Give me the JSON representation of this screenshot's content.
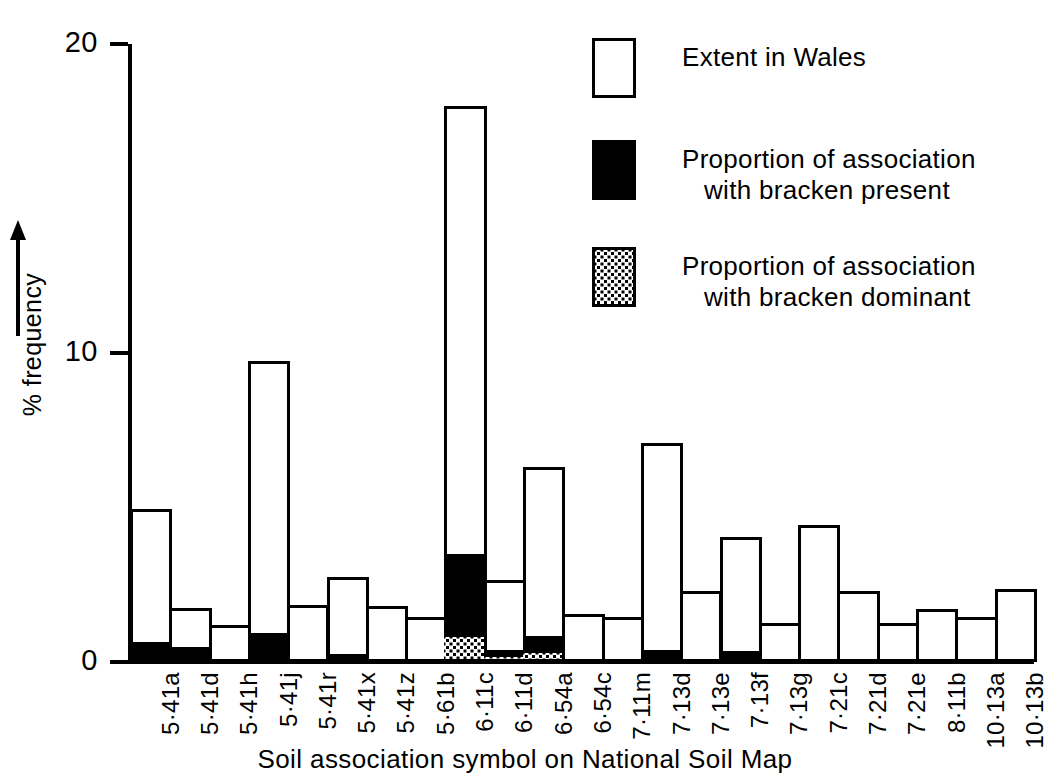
{
  "chart_data": {
    "type": "bar",
    "title": "",
    "xlabel": "Soil association symbol on National Soil Map",
    "ylabel": "% frequency",
    "ylim": [
      0,
      20
    ],
    "yticks": [
      0,
      10,
      20
    ],
    "ytick_labels": [
      "0",
      "10",
      "20"
    ],
    "grid": false,
    "legend_position": "top-right",
    "stacked": true,
    "note": "Each category is one bar. 'extent' is the full bar height (% frequency in Wales). 'present' and 'dominant' are sub-portions drawn from the baseline upward inside the same bar.",
    "categories": [
      "5·41a",
      "5·41d",
      "5·41h",
      "5·41j",
      "5·41r",
      "5·41x",
      "5·41z",
      "5·61b",
      "6·11c",
      "6·11d",
      "6·54a",
      "6·54c",
      "7·11m",
      "7·13d",
      "7·13e",
      "7·13f",
      "7·13g",
      "7·21c",
      "7·21d",
      "7·21e",
      "8·11b",
      "10·13a",
      "10·13b"
    ],
    "series": [
      {
        "name": "Extent in Wales",
        "key": "extent",
        "values": [
          4.95,
          1.75,
          1.2,
          9.75,
          1.85,
          2.75,
          1.8,
          1.45,
          18.0,
          2.65,
          6.3,
          1.55,
          1.45,
          7.1,
          2.3,
          4.05,
          1.25,
          4.45,
          2.3,
          1.25,
          1.7,
          1.45,
          2.35
        ]
      },
      {
        "name": "Proportion of association with bracken present",
        "key": "present",
        "values": [
          0.55,
          0.4,
          0,
          0.85,
          0,
          0.15,
          0,
          0,
          3.4,
          0.3,
          0.75,
          0,
          0,
          0.3,
          0,
          0.25,
          0,
          0,
          0,
          0,
          0,
          0,
          0
        ]
      },
      {
        "name": "Proportion of association with bracken dominant",
        "key": "dominant",
        "values": [
          0,
          0,
          0,
          0,
          0,
          0,
          0,
          0,
          0.8,
          0.15,
          0.3,
          0,
          0,
          0,
          0,
          0,
          0,
          0,
          0,
          0,
          0,
          0,
          0
        ]
      }
    ]
  },
  "axes": {
    "y_title": "% frequency",
    "y_arrow_icon": "up-arrow-icon",
    "x_title": "Soil association symbol on National Soil Map"
  },
  "legend": {
    "items": [
      {
        "swatch": "extent",
        "line1": "Extent in Wales",
        "line2": ""
      },
      {
        "swatch": "present",
        "line1": "Proportion of association",
        "line2": "with bracken present"
      },
      {
        "swatch": "dominant",
        "line1": "Proportion of association",
        "line2": "with bracken dominant"
      }
    ]
  }
}
